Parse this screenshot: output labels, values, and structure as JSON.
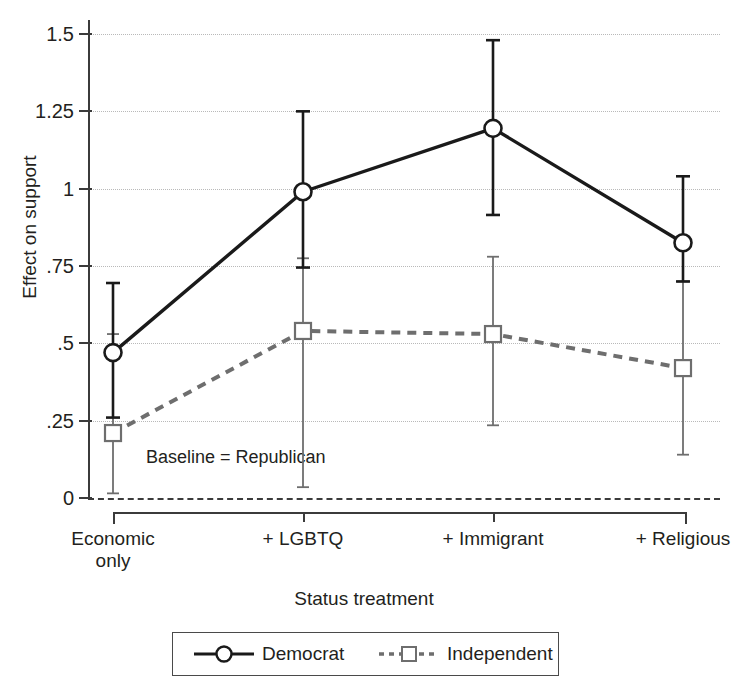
{
  "chart_data": {
    "type": "line",
    "title": "",
    "xlabel": "Status treatment",
    "ylabel": "Effect on support",
    "categories": [
      "Economic only",
      "+ LGBTQ",
      "+ Immigrant",
      "+ Religious"
    ],
    "category_lines": [
      [
        "Economic",
        "only"
      ],
      [
        "+ LGBTQ"
      ],
      [
        "+ Immigrant"
      ],
      [
        "+ Religious"
      ]
    ],
    "ylim": [
      0,
      1.5
    ],
    "ytick_values": [
      0,
      0.25,
      0.5,
      0.75,
      1,
      1.25,
      1.5
    ],
    "ytick_labels": [
      "0",
      ".25",
      ".5",
      ".75",
      "1",
      "1.25",
      "1.5"
    ],
    "grid": true,
    "legend_position": "bottom",
    "annotations": [
      {
        "text": "Baseline = Republican",
        "x_value": 0.35,
        "y_value": 0.165
      }
    ],
    "reference_line": {
      "y_value": 0,
      "style": "dashed",
      "color": "#3b3b3b"
    },
    "series": [
      {
        "name": "Democrat",
        "marker": "open-circle",
        "line_style": "solid",
        "color": "#1a1a1a",
        "values": [
          0.47,
          0.99,
          1.195,
          0.825
        ],
        "ci_lower": [
          0.26,
          0.745,
          0.915,
          0.7
        ],
        "ci_upper": [
          0.695,
          1.25,
          1.48,
          1.04
        ]
      },
      {
        "name": "Independent",
        "marker": "open-square",
        "line_style": "dotted",
        "color": "#6e6e6e",
        "values": [
          0.21,
          0.54,
          0.53,
          0.42
        ],
        "ci_lower": [
          0.015,
          0.035,
          0.235,
          0.14
        ],
        "ci_upper": [
          0.53,
          0.775,
          0.78,
          0.7
        ]
      }
    ]
  },
  "legend": {
    "items": [
      {
        "label": "Democrat",
        "marker": "open-circle",
        "line_style": "solid",
        "color": "#1a1a1a"
      },
      {
        "label": "Independent",
        "marker": "open-square",
        "line_style": "dotted",
        "color": "#6e6e6e"
      }
    ]
  }
}
